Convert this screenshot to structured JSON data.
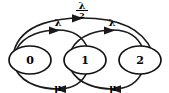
{
  "diagram": {
    "type": "state-transition-diagram",
    "background_color": "#ffffff",
    "stroke_color": "#1a1a1a",
    "text_color": "#000000",
    "nodes": [
      {
        "id": "state-0",
        "label": "0",
        "cx": 30,
        "cy": 60,
        "rx": 21,
        "ry": 14
      },
      {
        "id": "state-1",
        "label": "1",
        "cx": 85,
        "cy": 60,
        "rx": 21,
        "ry": 14
      },
      {
        "id": "state-2",
        "label": "2",
        "cx": 140,
        "cy": 60,
        "rx": 21,
        "ry": 14
      }
    ],
    "edges": [
      {
        "id": "edge-0-to-2",
        "from": "0",
        "to": "2",
        "label": "λ/2",
        "label_numerator": "λ",
        "label_denominator": "2",
        "is_fraction": true,
        "direction": "forward",
        "label_x": 82,
        "label_y": 10
      },
      {
        "id": "edge-0-to-1",
        "from": "0",
        "to": "1",
        "label": "λ",
        "is_fraction": false,
        "direction": "forward",
        "label_x": 58,
        "label_y": 32
      },
      {
        "id": "edge-1-to-2",
        "from": "1",
        "to": "2",
        "label": "λ",
        "is_fraction": false,
        "direction": "forward",
        "label_x": 112,
        "label_y": 32
      },
      {
        "id": "edge-1-to-0",
        "from": "1",
        "to": "0",
        "label": "μ",
        "is_fraction": false,
        "direction": "backward",
        "label_x": 58,
        "label_y": 87
      },
      {
        "id": "edge-2-to-1",
        "from": "2",
        "to": "1",
        "label": "μ",
        "is_fraction": false,
        "direction": "backward",
        "label_x": 113,
        "label_y": 87
      }
    ]
  }
}
